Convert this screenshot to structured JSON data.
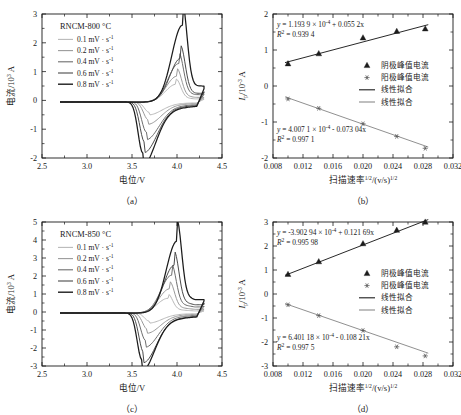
{
  "figure": {
    "panels": [
      "a",
      "b",
      "c",
      "d"
    ],
    "captions": {
      "a": "（a）",
      "b": "（b）",
      "c": "（c）",
      "d": "（d）"
    }
  },
  "cv_axis": {
    "xlabel": "电位/V",
    "ylabel_main": "电流/10",
    "ylabel_exp": "3",
    "ylabel_unit": " A",
    "xticks": [
      "2.5",
      "3.0",
      "3.5",
      "4.0",
      "4.5"
    ],
    "xlim": [
      2.5,
      4.5
    ]
  },
  "fit_axis": {
    "xlabel_main": "扫描速率",
    "xlabel_exp1": "1/2",
    "xlabel_mid": "/(v/s)",
    "xlabel_exp2": "1/2",
    "ylabel_sym": "I",
    "ylabel_sub": "p",
    "ylabel_main": "/10",
    "ylabel_exp": "-3",
    "ylabel_unit": " A",
    "xticks": [
      "0.008",
      "0.012",
      "0.016",
      "0.020",
      "0.024",
      "0.028",
      "0.032"
    ],
    "xlim": [
      0.008,
      0.032
    ]
  },
  "legend_cv": {
    "rates": [
      {
        "label": "0.1 mV · s",
        "exp": "-1",
        "color": "#b9b9b9"
      },
      {
        "label": "0.2 mV · s",
        "exp": "-1",
        "color": "#9a9a9a"
      },
      {
        "label": "0.4 mV · s",
        "exp": "-1",
        "color": "#6e6e6e"
      },
      {
        "label": "0.6 mV · s",
        "exp": "-1",
        "color": "#4a4a4a"
      },
      {
        "label": "0.8 mV · s",
        "exp": "-1",
        "color": "#1c1c1c"
      }
    ]
  },
  "legend_fit": {
    "items": [
      {
        "label": "阴极峰值电流",
        "marker": "triangle",
        "color": "#1c1c1c"
      },
      {
        "label": "阳极峰值电流",
        "marker": "star",
        "color": "#555555"
      },
      {
        "label": "线性拟合",
        "marker": "line",
        "color": "#1c1c1c"
      },
      {
        "label": "线性拟合",
        "marker": "line",
        "color": "#8a8a8a"
      }
    ]
  },
  "chart_data": [
    {
      "panel": "a",
      "type": "line",
      "title": "RNCM-800 °C",
      "xlabel": "电位/V",
      "ylabel": "电流/10^3 A",
      "xlim": [
        2.5,
        4.5
      ],
      "ylim": [
        -2,
        3
      ],
      "yticks": [
        -2,
        -1,
        0,
        1,
        2,
        3
      ],
      "grid": false,
      "legend_position": "top-left",
      "series": [
        {
          "name": "0.1 mV·s^-1",
          "color": "#b9b9b9",
          "anodic_peak": {
            "x": 3.99,
            "y": 0.62
          },
          "cathodic_peak": {
            "x": 3.69,
            "y": -0.36
          }
        },
        {
          "name": "0.2 mV·s^-1",
          "color": "#9a9a9a",
          "anodic_peak": {
            "x": 4.0,
            "y": 0.9
          },
          "cathodic_peak": {
            "x": 3.68,
            "y": -0.62
          }
        },
        {
          "name": "0.4 mV·s^-1",
          "color": "#6e6e6e",
          "anodic_peak": {
            "x": 4.02,
            "y": 1.34
          },
          "cathodic_peak": {
            "x": 3.66,
            "y": -1.05
          }
        },
        {
          "name": "0.6 mV·s^-1",
          "color": "#4a4a4a",
          "anodic_peak": {
            "x": 4.04,
            "y": 1.52
          },
          "cathodic_peak": {
            "x": 3.64,
            "y": -1.4
          }
        },
        {
          "name": "0.8 mV·s^-1",
          "color": "#1c1c1c",
          "anodic_peak": {
            "x": 4.06,
            "y": 2.67
          },
          "cathodic_peak": {
            "x": 3.62,
            "y": -1.78
          }
        }
      ]
    },
    {
      "panel": "b",
      "type": "scatter",
      "xlabel": "扫描速率^1/2/(v/s)^1/2",
      "ylabel": "Ip/10^-3 A",
      "xlim": [
        0.008,
        0.032
      ],
      "ylim": [
        -2,
        2
      ],
      "yticks": [
        -2,
        -1,
        0,
        1,
        2
      ],
      "grid": false,
      "legend_position": "center-right",
      "equations": [
        {
          "for": "cathodic",
          "text": "y = 1.193 9 × 10",
          "exp": "-4",
          "tail": " + 0.055 2x",
          "r2_label": "R",
          "r2_sup": "2",
          "r2_value": " = 0.939 4"
        },
        {
          "for": "anodic",
          "text": "y = 4.007 1 × 10",
          "exp": "-4",
          "tail": " - 0.073 04x",
          "r2_label": "R",
          "r2_sup": "2",
          "r2_value": " = 0.997 1"
        }
      ],
      "x": [
        0.01,
        0.0141,
        0.02,
        0.0245,
        0.0283
      ],
      "series": [
        {
          "name": "阴极峰值电流",
          "marker": "triangle",
          "color": "#1c1c1c",
          "values": [
            0.62,
            0.9,
            1.34,
            1.52,
            1.59
          ],
          "fit_color": "#1c1c1c",
          "slope": 55.2,
          "intercept": 0.1194
        },
        {
          "name": "阳极峰值电流",
          "marker": "star",
          "color": "#555555",
          "values": [
            -0.36,
            -0.62,
            -1.05,
            -1.4,
            -1.73
          ],
          "fit_color": "#8a8a8a",
          "slope": -73.04,
          "intercept": 0.4007
        }
      ]
    },
    {
      "panel": "c",
      "type": "line",
      "title": "RNCM-850 °C",
      "xlabel": "电位/V",
      "ylabel": "电流/10^3 A",
      "xlim": [
        2.5,
        4.5
      ],
      "ylim": [
        -3,
        5
      ],
      "yticks": [
        -3,
        -2,
        -1,
        0,
        1,
        2,
        3,
        4,
        5
      ],
      "grid": false,
      "legend_position": "top-left",
      "series": [
        {
          "name": "0.1 mV·s^-1",
          "color": "#b9b9b9",
          "anodic_peak": {
            "x": 3.9,
            "y": 0.82
          },
          "cathodic_peak": {
            "x": 3.69,
            "y": -0.45
          }
        },
        {
          "name": "0.2 mV·s^-1",
          "color": "#9a9a9a",
          "anodic_peak": {
            "x": 3.92,
            "y": 1.35
          },
          "cathodic_peak": {
            "x": 3.67,
            "y": -0.9
          }
        },
        {
          "name": "0.4 mV·s^-1",
          "color": "#6e6e6e",
          "anodic_peak": {
            "x": 3.94,
            "y": 2.1
          },
          "cathodic_peak": {
            "x": 3.65,
            "y": -1.52
          }
        },
        {
          "name": "0.6 mV·s^-1",
          "color": "#4a4a4a",
          "anodic_peak": {
            "x": 3.97,
            "y": 2.66
          },
          "cathodic_peak": {
            "x": 3.63,
            "y": -2.2
          }
        },
        {
          "name": "0.8 mV·s^-1",
          "color": "#1c1c1c",
          "anodic_peak": {
            "x": 4.0,
            "y": 4.0
          },
          "cathodic_peak": {
            "x": 3.61,
            "y": -2.6
          }
        }
      ]
    },
    {
      "panel": "d",
      "type": "scatter",
      "xlabel": "扫描速率^1/2/(v/s)^1/2",
      "ylabel": "Ip/10^-3 A",
      "xlim": [
        0.008,
        0.032
      ],
      "ylim": [
        -3,
        3
      ],
      "yticks": [
        -3,
        -2,
        -1,
        0,
        1,
        2,
        3
      ],
      "grid": false,
      "legend_position": "center-right",
      "equations": [
        {
          "for": "cathodic",
          "text": "y = -3.902 94 × 10",
          "exp": "-4",
          "tail": " + 0.121 69x",
          "r2_label": "R",
          "r2_sup": "2",
          "r2_value": " = 0.995 98"
        },
        {
          "for": "anodic",
          "text": "y = 6.401 18 × 10",
          "exp": "-4",
          "tail": " - 0.108 21x",
          "r2_label": "R",
          "r2_sup": "2",
          "r2_value": " = 0.997 5"
        }
      ],
      "x": [
        0.01,
        0.0141,
        0.02,
        0.0245,
        0.0283
      ],
      "series": [
        {
          "name": "阴极峰值电流",
          "marker": "triangle",
          "color": "#1c1c1c",
          "values": [
            0.82,
            1.35,
            2.1,
            2.66,
            3.0
          ],
          "fit_color": "#1c1c1c",
          "slope": 121.69,
          "intercept": -0.3903
        },
        {
          "name": "阳极峰值电流",
          "marker": "star",
          "color": "#555555",
          "values": [
            -0.45,
            -0.9,
            -1.52,
            -2.2,
            -2.58
          ],
          "fit_color": "#8a8a8a",
          "slope": -108.21,
          "intercept": 0.6401
        }
      ]
    }
  ]
}
